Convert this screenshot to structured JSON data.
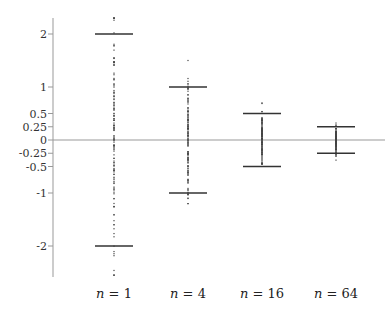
{
  "chart_data": {
    "type": "scatter",
    "title": "",
    "xlabel": "",
    "ylabel": "",
    "ylim": [
      -2.6,
      2.35
    ],
    "grid": false,
    "legend": null,
    "y_ticks": [
      2,
      1,
      0.5,
      0.25,
      0,
      -0.25,
      -0.5,
      -1,
      -2
    ],
    "y_tick_labels": [
      "2",
      "1",
      "0.5",
      "0.25",
      "0",
      "-0.25",
      "-0.5",
      "-1",
      "-2"
    ],
    "categories": [
      "n = 1",
      "n = 4",
      "n = 16",
      "n = 64"
    ],
    "category_var": "n",
    "category_values": [
      "1",
      "4",
      "16",
      "64"
    ],
    "series": [
      {
        "name": "n = 1",
        "n": 1,
        "upper_bar": 2,
        "lower_bar": -2,
        "data_min": -2.55,
        "data_max": 2.3
      },
      {
        "name": "n = 4",
        "n": 4,
        "upper_bar": 1,
        "lower_bar": -1,
        "data_min": -1.2,
        "data_max": 1.5
      },
      {
        "name": "n = 16",
        "n": 16,
        "upper_bar": 0.5,
        "lower_bar": -0.5,
        "data_min": -0.45,
        "data_max": 0.7
      },
      {
        "name": "n = 64",
        "n": 64,
        "upper_bar": 0.25,
        "lower_bar": -0.25,
        "data_min": -0.38,
        "data_max": 0.32
      }
    ],
    "reference_line": {
      "y": 0
    }
  },
  "colors": {
    "axis": "#999999",
    "bars": "#333333",
    "points": "#444444",
    "zero_line": "#999999"
  }
}
